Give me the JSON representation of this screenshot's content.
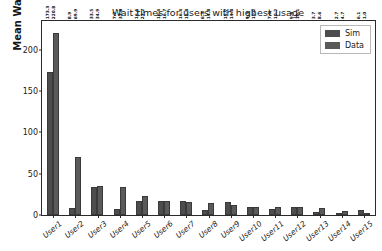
{
  "chart_data": {
    "type": "bar",
    "title": "Wait times for users with highest usage",
    "xlabel": "",
    "ylabel": "Mean Wait Time (hrs)",
    "ylim": [
      0,
      235
    ],
    "yticks": [
      0,
      50,
      100,
      150,
      200
    ],
    "grid": false,
    "legend_position": "upper right",
    "categories": [
      "User1",
      "User2",
      "User3",
      "User4",
      "User5",
      "User6",
      "User7",
      "User8",
      "User9",
      "User10",
      "User11",
      "User12",
      "User13",
      "User14",
      "User15"
    ],
    "series": [
      {
        "name": "Sim",
        "values": [
          173.3,
          8.9,
          33.5,
          7.7,
          16.6,
          16.4,
          16.4,
          6.3,
          15.7,
          9.3,
          7.6,
          9.6,
          3.7,
          2.7,
          6.1
        ]
      },
      {
        "name": "Data",
        "values": [
          220.8,
          69.9,
          34.9,
          33.8,
          23.2,
          16.7,
          15.8,
          14.8,
          11.8,
          10.2,
          10.2,
          10.1,
          8.6,
          4.7,
          1.0
        ]
      }
    ],
    "bar_labels": {
      "Sim": [
        "173.3",
        "8.9",
        "33.5",
        "7.7",
        "16.6",
        "16.4",
        "16.4",
        "6.3",
        "15.7",
        "9.3",
        "7.6",
        "9.6",
        "3.7",
        "2.7",
        "6.1"
      ],
      "Data": [
        "220.8",
        "69.9",
        "34.9",
        "33.8",
        "23.2",
        "16.7",
        "15.8",
        "14.8",
        "11.8",
        "10.2",
        "10.2",
        "10.1",
        "8.6",
        "4.7",
        "1.0"
      ]
    },
    "colors": {
      "sim": "#4d4d4d",
      "data": "#5a5a5a",
      "axis": "#2a2a2a",
      "text": "#1a1a1a",
      "background": "#ffffff"
    }
  },
  "legend": {
    "items": [
      {
        "label": "Sim"
      },
      {
        "label": "Data"
      }
    ]
  }
}
